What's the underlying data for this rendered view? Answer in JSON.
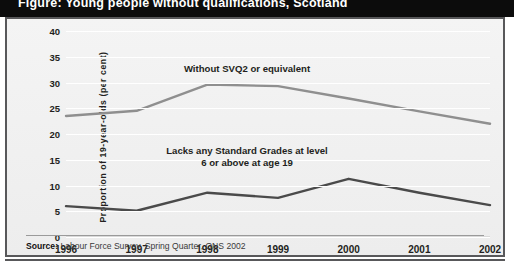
{
  "title": "Figure: Young people without qualifications, Scotland",
  "chart_data": {
    "type": "line",
    "title": "Figure: Young people without qualifications, Scotland",
    "xlabel": "",
    "ylabel": "Proportion of 19-year-olds (per cent)",
    "categories": [
      "1996",
      "1997",
      "1998",
      "1999",
      "2000",
      "2001",
      "2002"
    ],
    "yticks": [
      "0",
      "5",
      "10",
      "15",
      "20",
      "25",
      "30",
      "35",
      "40"
    ],
    "ylim": [
      0,
      40
    ],
    "grid": true,
    "legend_position": "inline-annotation",
    "series": [
      {
        "name": "Without SVQ2 or equivalent",
        "color": "#8f8f8f",
        "values": [
          23.5,
          24.5,
          29.6,
          29.3,
          26.9,
          24.4,
          22.0
        ]
      },
      {
        "name": "Lacks any Standard Grades at level 6 or above at age 19",
        "color": "#4a4a4a",
        "values": [
          6.0,
          5.1,
          8.6,
          7.6,
          11.3,
          8.6,
          6.2
        ]
      }
    ],
    "annotations": [
      {
        "text": "Without SVQ2 or equivalent",
        "series": "Without SVQ2 or equivalent"
      },
      {
        "text": "Lacks any Standard Grades at level\n6 or above at age 19",
        "series": "Lacks any Standard Grades at level 6 or above at age 19"
      }
    ]
  },
  "source": {
    "label": "Source:",
    "text": " Labour Force Survey, Spring Quarter, ONS 2002"
  },
  "colors": {
    "band": "#0c0c0c",
    "panel_border": "#58585a",
    "panel_bg": "#f1f1f1",
    "series_light": "#8f8f8f",
    "series_dark": "#4a4a4a"
  }
}
